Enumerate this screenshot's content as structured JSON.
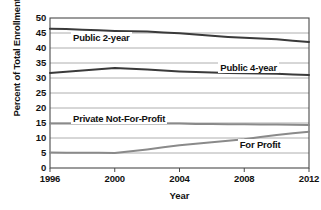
{
  "chart_data": {
    "type": "line",
    "title": "",
    "xlabel": "Year",
    "ylabel": "Percent of Total Enrollment",
    "x": [
      1996,
      1997,
      1998,
      1999,
      2000,
      2001,
      2002,
      2003,
      2004,
      2005,
      2006,
      2007,
      2008,
      2009,
      2010,
      2011,
      2012
    ],
    "xlim": [
      1996,
      2012
    ],
    "ylim": [
      0,
      50
    ],
    "ytick_labels": [
      "50",
      "45",
      "40",
      "35",
      "30",
      "25",
      "20",
      "15",
      "10",
      "5",
      "0"
    ],
    "ytick_values": [
      50,
      45,
      40,
      35,
      30,
      25,
      20,
      15,
      10,
      5,
      0
    ],
    "xtick_labels": [
      "1996",
      "2000",
      "2004",
      "2008",
      "2012"
    ],
    "xtick_values": [
      1996,
      2000,
      2004,
      2008,
      2012
    ],
    "grid": true,
    "legend": "inline-labels",
    "series": [
      {
        "name": "Public 2-year",
        "color": "#3a3a3a",
        "label_x": 1997.3,
        "label_y": 43.4,
        "values": [
          46.4,
          46.3,
          46.1,
          45.9,
          45.7,
          45.6,
          45.5,
          45.2,
          44.9,
          44.5,
          44.1,
          43.7,
          43.4,
          43.2,
          42.9,
          42.4,
          42.0
        ]
      },
      {
        "name": "Public 4-year",
        "color": "#3a3a3a",
        "label_x": 2006.4,
        "label_y": 33.4,
        "values": [
          31.7,
          32.1,
          32.5,
          32.9,
          33.3,
          33.1,
          32.8,
          32.5,
          32.2,
          32.0,
          31.8,
          31.7,
          31.6,
          31.5,
          31.4,
          31.2,
          31.0
        ]
      },
      {
        "name": "Private Not-For-Profit",
        "color": "#8a8a8a",
        "label_x": 1997.3,
        "label_y": 16.3,
        "values": [
          14.8,
          14.8,
          14.8,
          14.8,
          14.8,
          14.8,
          14.8,
          14.8,
          14.8,
          14.7,
          14.7,
          14.6,
          14.6,
          14.5,
          14.5,
          14.4,
          14.3
        ]
      },
      {
        "name": "For Profit",
        "color": "#8a8a8a",
        "label_x": 2007.6,
        "label_y": 7.6,
        "values": [
          5.2,
          5.1,
          5.1,
          5.1,
          5.0,
          5.6,
          6.2,
          6.9,
          7.6,
          8.1,
          8.6,
          9.1,
          9.6,
          10.3,
          11.0,
          11.6,
          12.1
        ]
      }
    ]
  },
  "plot": {
    "left": 50,
    "right": 309,
    "top": 18,
    "bottom": 168
  }
}
